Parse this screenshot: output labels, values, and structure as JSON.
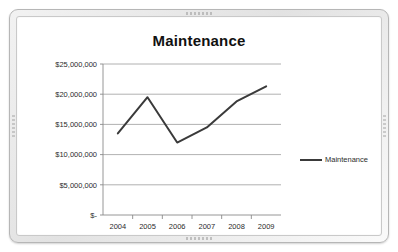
{
  "board": {
    "frame_color": "#e2e2e2",
    "surface_color": "#ffffff"
  },
  "chart_data": {
    "type": "line",
    "title": "Maintenance",
    "xlabel": "",
    "ylabel": "",
    "categories": [
      "2004",
      "2005",
      "2006",
      "2007",
      "2008",
      "2009"
    ],
    "series": [
      {
        "name": "Maintenance",
        "values": [
          13500000,
          19500000,
          12000000,
          14500000,
          18800000,
          21300000
        ],
        "color": "#3a3a3a"
      }
    ],
    "ylim": [
      0,
      25000000
    ],
    "ytick_values": [
      0,
      5000000,
      10000000,
      15000000,
      20000000,
      25000000
    ],
    "ytick_labels": [
      "$-",
      "$5,000,000",
      "$10,000,000",
      "$15,000,000",
      "$20,000,000",
      "$25,000,000"
    ],
    "grid": true,
    "legend_position": "right",
    "legend_entries": [
      "Maintenance"
    ]
  }
}
